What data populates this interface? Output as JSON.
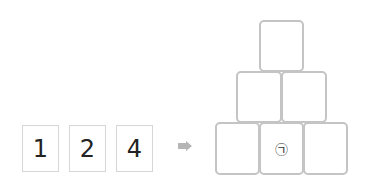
{
  "cards": [
    {
      "label": "1"
    },
    {
      "label": "2"
    },
    {
      "label": "4"
    }
  ],
  "arrow": {
    "icon": "arrow-right-icon",
    "color": "#b5b5b5"
  },
  "pyramid": {
    "top": [
      {
        "label": ""
      }
    ],
    "middle": [
      {
        "label": ""
      },
      {
        "label": ""
      }
    ],
    "bottom": [
      {
        "label": ""
      },
      {
        "label": "㉠"
      },
      {
        "label": ""
      }
    ]
  }
}
